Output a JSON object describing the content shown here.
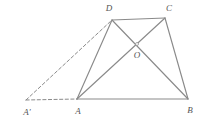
{
  "figure": {
    "type": "geometry-diagram",
    "canvas": {
      "width": 209,
      "height": 121,
      "background": "#ffffff"
    },
    "style": {
      "solid_stroke": "#8a8a8a",
      "solid_width": 1.15,
      "dashed_stroke": "#8a8a8a",
      "dashed_width": 1.0,
      "dash_pattern": "3.2 2.4",
      "label_color": "#555555",
      "label_font_size": "9px"
    },
    "points": [
      {
        "name": "A'",
        "label": "A'",
        "x": 26,
        "y": 100,
        "label_x": 27,
        "label_y": 112
      },
      {
        "name": "A",
        "label": "A",
        "x": 77,
        "y": 99,
        "label_x": 78,
        "label_y": 111
      },
      {
        "name": "B",
        "label": "B",
        "x": 188,
        "y": 99,
        "label_x": 190,
        "label_y": 110
      },
      {
        "name": "C",
        "label": "C",
        "x": 165,
        "y": 18,
        "label_x": 169,
        "label_y": 8
      },
      {
        "name": "D",
        "label": "D",
        "x": 112,
        "y": 20,
        "label_x": 109,
        "label_y": 8
      },
      {
        "name": "O",
        "label": "O",
        "x": 137,
        "y": 44,
        "label_x": 137,
        "label_y": 55
      }
    ],
    "solid_segments": [
      {
        "name": "segment-AB",
        "from": "A",
        "to": "B",
        "x1": 77,
        "y1": 99,
        "x2": 188,
        "y2": 99
      },
      {
        "name": "segment-DC",
        "from": "D",
        "to": "C",
        "x1": 112,
        "y1": 20,
        "x2": 165,
        "y2": 18
      },
      {
        "name": "segment-AD",
        "from": "A",
        "to": "D",
        "x1": 77,
        "y1": 99,
        "x2": 112,
        "y2": 20
      },
      {
        "name": "segment-AC",
        "from": "A",
        "to": "C",
        "x1": 77,
        "y1": 99,
        "x2": 165,
        "y2": 18
      },
      {
        "name": "segment-DB",
        "from": "D",
        "to": "B",
        "x1": 112,
        "y1": 20,
        "x2": 188,
        "y2": 99
      },
      {
        "name": "segment-CB",
        "from": "C",
        "to": "B",
        "x1": 165,
        "y1": 18,
        "x2": 188,
        "y2": 99
      }
    ],
    "dashed_segments": [
      {
        "name": "segment-Aprime-A",
        "from": "A'",
        "to": "A",
        "x1": 26,
        "y1": 100,
        "x2": 77,
        "y2": 99
      },
      {
        "name": "segment-Aprime-D",
        "from": "A'",
        "to": "D",
        "x1": 26,
        "y1": 100,
        "x2": 112,
        "y2": 20
      }
    ],
    "intersection_marker": {
      "name": "point-O-marker",
      "cx": 137,
      "cy": 44,
      "r": 1.5
    }
  }
}
